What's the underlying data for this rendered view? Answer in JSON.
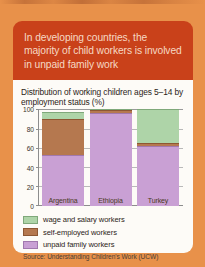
{
  "colors": {
    "page_background": "#e8914a",
    "callout_background": "#c9411a",
    "callout_text": "#f6d9c4",
    "panel_background": "#fdfbf7",
    "wage_and_salary": "#aed4a8",
    "self_employed": "#b5784f",
    "unpaid_family": "#c9a0d4",
    "axis": "#8d8d8d",
    "gridline": "#b9b9b9"
  },
  "callout": {
    "text": "In developing countries, the majority of child workers is involved in unpaid family work"
  },
  "chart_data": {
    "type": "bar",
    "stacked": true,
    "title": "Distribution of working children ages 5–14 by employment status (%)",
    "xlabel": "",
    "ylabel": "",
    "ylim": [
      0,
      100
    ],
    "yticks": [
      100,
      80,
      60,
      40,
      20,
      0
    ],
    "grid": true,
    "legend_position": "below-plot",
    "categories": [
      "Argentina",
      "Ethiopia",
      "Turkey"
    ],
    "series": [
      {
        "name": "unpaid family workers",
        "color": "#c9a0d4",
        "values": [
          53,
          96,
          62
        ]
      },
      {
        "name": "self-employed workers",
        "color": "#b5784f",
        "values": [
          37,
          3,
          3
        ]
      },
      {
        "name": "wage and salary workers",
        "color": "#aed4a8",
        "values": [
          7,
          1,
          35
        ]
      }
    ],
    "source": "Source: Understanding Children's Work (UCW)"
  },
  "legend": [
    {
      "label": "wage and salary workers",
      "swatch": "green"
    },
    {
      "label": "self-employed workers",
      "swatch": "brown"
    },
    {
      "label": "unpaid family workers",
      "swatch": "purple"
    }
  ]
}
